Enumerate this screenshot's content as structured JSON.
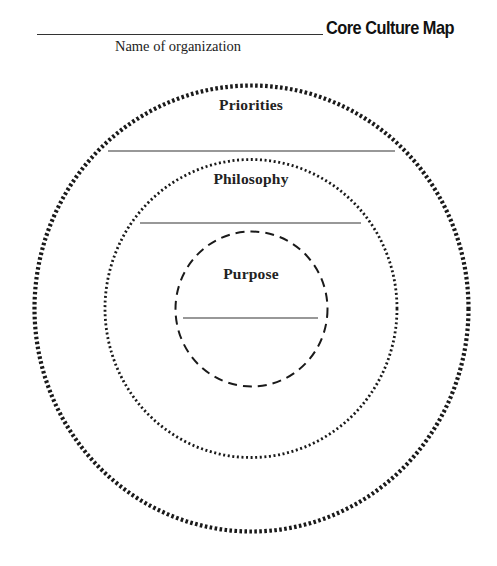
{
  "header": {
    "title": "Core Culture Map",
    "org_caption": "Name of organization",
    "org_name_value": ""
  },
  "rings": [
    {
      "label": "Priorities",
      "style": "heavy-dotted",
      "value": ""
    },
    {
      "label": "Philosophy",
      "style": "fine-dotted",
      "value": ""
    },
    {
      "label": "Purpose",
      "style": "dashed",
      "value": ""
    }
  ],
  "colors": {
    "ink": "#1a1a1a",
    "background": "#ffffff"
  }
}
